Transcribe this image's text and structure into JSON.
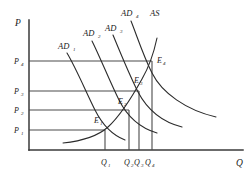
{
  "figure": {
    "title_fragment": "",
    "axes": {
      "y_label": "P",
      "x_label": "Q",
      "y_axis_name": "price-level",
      "x_axis_name": "output"
    },
    "price_ticks": [
      {
        "label": "P",
        "sub": "4",
        "y": 61
      },
      {
        "label": "P",
        "sub": "3",
        "y": 91
      },
      {
        "label": "P",
        "sub": "2",
        "y": 110
      },
      {
        "label": "P",
        "sub": "1",
        "y": 130
      }
    ],
    "quantity_ticks": [
      {
        "label": "Q",
        "sub": "1",
        "x": 105
      },
      {
        "label": "Q",
        "sub": "2",
        "x": 129
      },
      {
        "label": "Q",
        "sub": "3",
        "x": 139
      },
      {
        "label": "Q",
        "sub": "4",
        "x": 152
      }
    ],
    "demand_curves": [
      {
        "name": "AD",
        "sub": "1",
        "label_x": 61,
        "label_y": 48
      },
      {
        "name": "AD",
        "sub": "2",
        "label_x": 87,
        "label_y": 35
      },
      {
        "name": "AD",
        "sub": "3",
        "label_x": 108,
        "label_y": 29
      },
      {
        "name": "AD",
        "sub": "4",
        "label_x": 124,
        "label_y": 15
      }
    ],
    "supply_curve": {
      "name": "AS",
      "sub": "",
      "label_x": 152,
      "label_y": 15
    },
    "equilibria": [
      {
        "label": "E",
        "sub": "1",
        "x": 105,
        "y": 130,
        "label_x": 96,
        "label_y": 120
      },
      {
        "label": "E",
        "sub": "2",
        "x": 129,
        "y": 110,
        "label_x": 120,
        "label_y": 101
      },
      {
        "label": "E",
        "sub": "3",
        "x": 139,
        "y": 91,
        "label_x": 136,
        "label_y": 80
      },
      {
        "label": "E",
        "sub": "4",
        "x": 152,
        "y": 61,
        "label_x": 158,
        "label_y": 60
      }
    ],
    "colors": {
      "axis": "#3a3a3a",
      "curve": "#2b2b2b",
      "grid": "#4a4a4a",
      "background": "#ffffff"
    }
  }
}
